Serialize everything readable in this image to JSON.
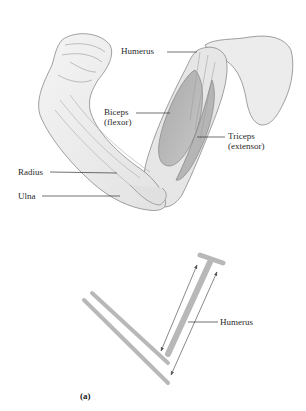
{
  "figure": {
    "panel_label": "(a)",
    "anatomy": {
      "labels": {
        "humerus": "Humerus",
        "biceps_line1": "Biceps",
        "biceps_line2": "(flexor)",
        "triceps_line1": "Triceps",
        "triceps_line2": "(extensor)",
        "radius": "Radius",
        "ulna": "Ulna"
      }
    },
    "schematic": {
      "labels": {
        "humerus": "Humerus"
      },
      "colors": {
        "bone": "#b8b8b8",
        "arrow": "#555555"
      }
    }
  }
}
